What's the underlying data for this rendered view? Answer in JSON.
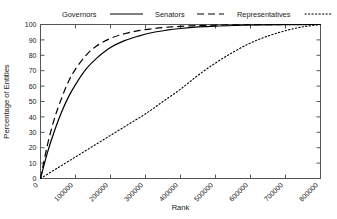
{
  "chart_data": {
    "type": "line",
    "title": "",
    "xlabel": "Rank",
    "ylabel": "Percentage of Entities",
    "xlim": [
      0,
      800000
    ],
    "ylim": [
      0,
      100
    ],
    "grid": false,
    "legend_position": "top",
    "xticks": [
      0,
      100000,
      200000,
      300000,
      400000,
      500000,
      600000,
      700000,
      800000
    ],
    "xtick_labels": [
      "0",
      "100000",
      "200000",
      "300000",
      "400000",
      "500000",
      "600000",
      "700000",
      "800000"
    ],
    "yticks": [
      0,
      10,
      20,
      30,
      40,
      50,
      60,
      70,
      80,
      90,
      100
    ],
    "ytick_labels": [
      "0",
      "10",
      "20",
      "30",
      "40",
      "50",
      "60",
      "70",
      "80",
      "90",
      "100"
    ],
    "series": [
      {
        "name": "Governors",
        "style": "solid",
        "color": "#000000",
        "x": [
          0,
          20000,
          40000,
          60000,
          80000,
          100000,
          130000,
          160000,
          200000,
          240000,
          280000,
          320000,
          360000,
          400000,
          450000,
          500000,
          560000,
          620000,
          700000,
          800000
        ],
        "values": [
          0,
          17,
          31,
          43,
          53,
          61,
          71,
          78,
          85,
          89.5,
          92.5,
          94.8,
          96.3,
          97.4,
          98.4,
          99.0,
          99.4,
          99.7,
          99.9,
          100
        ]
      },
      {
        "name": "Senators",
        "style": "dashed",
        "color": "#000000",
        "x": [
          0,
          20000,
          40000,
          60000,
          80000,
          100000,
          130000,
          160000,
          200000,
          240000,
          280000,
          320000,
          360000,
          400000,
          450000,
          500000,
          560000,
          620000,
          700000,
          800000
        ],
        "values": [
          0,
          22,
          39,
          52,
          63,
          71,
          80,
          86,
          91,
          94,
          96,
          97.3,
          98.2,
          98.8,
          99.3,
          99.6,
          99.8,
          99.9,
          100,
          100
        ]
      },
      {
        "name": "Representatives",
        "style": "dotted",
        "color": "#000000",
        "x": [
          0,
          50000,
          100000,
          150000,
          200000,
          250000,
          300000,
          350000,
          400000,
          450000,
          500000,
          550000,
          600000,
          650000,
          700000,
          750000,
          800000
        ],
        "values": [
          0,
          7,
          14,
          21,
          28,
          35,
          42,
          50,
          58,
          67,
          75,
          82,
          88,
          92.5,
          96,
          98.5,
          100
        ]
      }
    ]
  },
  "legend": {
    "items": [
      {
        "label": "Governors",
        "style": "solid"
      },
      {
        "label": "Senators",
        "style": "dashed"
      },
      {
        "label": "Representatives",
        "style": "dotted"
      }
    ]
  }
}
